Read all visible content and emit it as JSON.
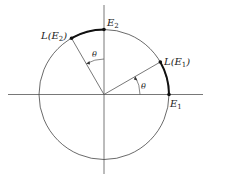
{
  "diagram": {
    "type": "unit-circle-rotation",
    "colors": {
      "stroke": "#444444",
      "arc": "#111111",
      "background": "#ffffff"
    },
    "labels": {
      "e1": {
        "main": "E",
        "sub": "1"
      },
      "e2": {
        "main": "E",
        "sub": "2"
      },
      "le1": {
        "pre": "L(E",
        "sub": "1",
        "post": ")"
      },
      "le2": {
        "pre": "L(E",
        "sub": "2",
        "post": ")"
      },
      "theta1": "θ",
      "theta2": "θ"
    },
    "angle_theta_deg": 30
  }
}
